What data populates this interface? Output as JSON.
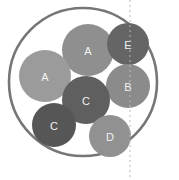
{
  "canvas": {
    "width": 179,
    "height": 180,
    "background": "#ffffff"
  },
  "chart_data": {
    "type": "scatter",
    "title": "",
    "subtitle": "",
    "xlabel": "",
    "ylabel": "",
    "grid": false,
    "legend": null,
    "categories": [
      "A",
      "E",
      "A",
      "B",
      "C",
      "C",
      "D"
    ],
    "values": [
      26,
      21,
      26,
      22,
      24,
      22,
      21
    ],
    "points": [
      {
        "label": "A",
        "cx": 88,
        "cy": 50,
        "r": 26,
        "fill": "#8f8f8f"
      },
      {
        "label": "E",
        "cx": 128,
        "cy": 44,
        "r": 21,
        "fill": "#656565"
      },
      {
        "label": "A",
        "cx": 45,
        "cy": 76,
        "r": 26,
        "fill": "#9b9b9b"
      },
      {
        "label": "B",
        "cx": 128,
        "cy": 86,
        "r": 22,
        "fill": "#8b8b8b"
      },
      {
        "label": "C",
        "cx": 86,
        "cy": 100,
        "r": 24,
        "fill": "#5f5f5f"
      },
      {
        "label": "C",
        "cx": 54,
        "cy": 125,
        "r": 22,
        "fill": "#565656"
      },
      {
        "label": "D",
        "cx": 110,
        "cy": 136,
        "r": 21,
        "fill": "#919191"
      }
    ]
  },
  "outer_circle": {
    "name": "boundary-circle",
    "cx": 83,
    "cy": 82,
    "r": 74,
    "stroke": "#767676",
    "stroke_width": 2.6,
    "fill": "none"
  },
  "dashed_line": {
    "name": "vertical-reference-line",
    "x": 130,
    "y_start": 0,
    "y_end": 180,
    "stroke": "#b8b8b8",
    "stroke_width": 1,
    "dash_pattern": "2 3"
  },
  "palette": {
    "background": "#ffffff",
    "outline": "#767676",
    "label_text": "#f2f2f2",
    "dash": "#b8b8b8"
  }
}
